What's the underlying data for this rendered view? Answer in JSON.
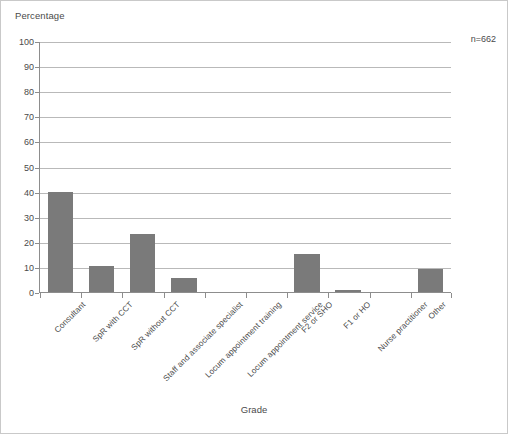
{
  "chart_data": {
    "type": "bar",
    "title": "",
    "xlabel": "Grade",
    "ylabel": "Percentage",
    "ylim": [
      0,
      100
    ],
    "ytick_step": 10,
    "yticks": [
      100,
      90,
      80,
      70,
      60,
      50,
      40,
      30,
      20,
      10,
      0
    ],
    "grid": true,
    "legend": "none",
    "annotation": "n=662",
    "bar_color": "#7a7a7a",
    "categories": [
      "Consultant",
      "SpR with CCT",
      "SpR without CCT",
      "Staff and associate specialist",
      "Locum appointment training",
      "Locum appointment service",
      "F2 or SHO",
      "F1 or HO",
      "Nurse practitioner",
      "Other"
    ],
    "values": [
      40,
      10.5,
      23,
      5.5,
      0,
      0,
      15,
      1,
      0,
      9
    ]
  },
  "axes": {
    "y_title": "Percentage",
    "x_title": "Grade"
  }
}
